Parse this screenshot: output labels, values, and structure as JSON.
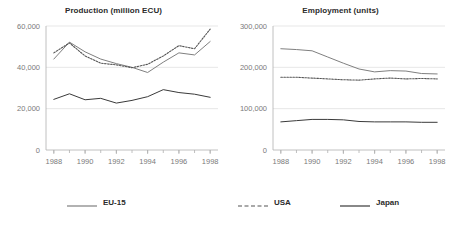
{
  "figure": {
    "background": "#ffffff",
    "text_color": "#3c3c3c"
  },
  "legend": {
    "position": "bottom",
    "items": [
      {
        "label": "EU-15",
        "color": "#7f7f7f",
        "style": "solid"
      },
      {
        "label": "USA",
        "color": "#555555",
        "style": "dashed"
      },
      {
        "label": "Japan",
        "color": "#3a3a3a",
        "style": "solid"
      }
    ]
  },
  "chart_data": [
    {
      "type": "line",
      "title": "Production (million ECU)",
      "xlabel": "",
      "ylabel": "",
      "grid": true,
      "legend_position": "bottom",
      "x": [
        1988,
        1989,
        1990,
        1991,
        1992,
        1993,
        1994,
        1995,
        1996,
        1997,
        1998
      ],
      "xlim": [
        1987.5,
        1998.5
      ],
      "xticks": [
        1988,
        1990,
        1992,
        1994,
        1996,
        1998
      ],
      "xticklabels": [
        "1988",
        "1990",
        "1992",
        "1994",
        "1996",
        "1998"
      ],
      "ylim": [
        0,
        60000
      ],
      "yticks": [
        0,
        20000,
        40000,
        60000
      ],
      "yticklabels": [
        "0",
        "20,000",
        "40,000",
        "60,000"
      ],
      "series": [
        {
          "name": "EU-15",
          "color": "#7f7f7f",
          "style": "solid",
          "values": [
            44000,
            52200,
            47500,
            44000,
            41800,
            40000,
            37500,
            42500,
            47000,
            46000,
            52500
          ]
        },
        {
          "name": "USA",
          "color": "#555555",
          "style": "dashed",
          "values": [
            47000,
            51800,
            45500,
            42000,
            41200,
            39800,
            41500,
            45500,
            50500,
            49000,
            58500
          ]
        },
        {
          "name": "Japan",
          "color": "#3a3a3a",
          "style": "solid",
          "values": [
            24500,
            27200,
            24300,
            25000,
            22700,
            24000,
            25800,
            29200,
            27800,
            27000,
            25500
          ]
        }
      ],
      "series_end_index": [
        10,
        10,
        10
      ]
    },
    {
      "type": "line",
      "title": "Employment (units)",
      "xlabel": "",
      "ylabel": "",
      "grid": true,
      "legend_position": "bottom",
      "x": [
        1988,
        1989,
        1990,
        1991,
        1992,
        1993,
        1994,
        1995,
        1996,
        1997,
        1998
      ],
      "xlim": [
        1987.5,
        1998.5
      ],
      "xticks": [
        1988,
        1990,
        1992,
        1994,
        1996,
        1998
      ],
      "xticklabels": [
        "1988",
        "1990",
        "1992",
        "1994",
        "1996",
        "1998"
      ],
      "ylim": [
        0,
        300000
      ],
      "yticks": [
        0,
        100000,
        200000,
        300000
      ],
      "yticklabels": [
        "0",
        "100,000",
        "200,000",
        "300,000"
      ],
      "series": [
        {
          "name": "EU-15",
          "color": "#7f7f7f",
          "style": "solid",
          "values": [
            245000,
            243000,
            240000,
            225000,
            210000,
            196000,
            189000,
            192000,
            191000,
            185000,
            184000
          ]
        },
        {
          "name": "USA",
          "color": "#555555",
          "style": "dashed",
          "values": [
            176000,
            176000,
            174000,
            172000,
            170000,
            169000,
            172000,
            174000,
            172000,
            173000,
            172000
          ]
        },
        {
          "name": "Japan",
          "color": "#3a3a3a",
          "style": "solid",
          "values": [
            68000,
            71000,
            74000,
            74000,
            73000,
            69000,
            68000,
            68000,
            68000,
            67000,
            67000
          ]
        }
      ],
      "series_end_index": [
        10,
        10,
        10
      ]
    }
  ]
}
